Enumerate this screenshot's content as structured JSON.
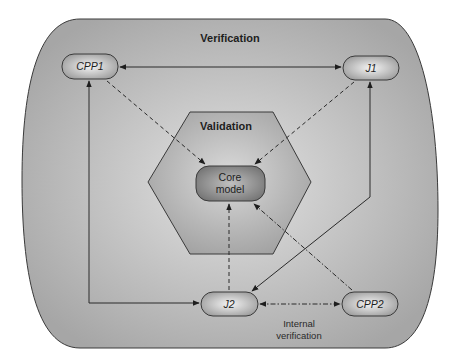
{
  "diagram": {
    "outer_region": {
      "label": "Verification"
    },
    "inner_region": {
      "label": "Validation"
    },
    "nodes": {
      "cpp1": {
        "label": "CPP1"
      },
      "j1": {
        "label": "J1"
      },
      "core": {
        "line1": "Core",
        "line2": "model"
      },
      "j2": {
        "label": "J2"
      },
      "cpp2": {
        "label": "CPP2"
      }
    },
    "annotations": {
      "internal_line1": "Internal",
      "internal_line2": "verification"
    },
    "edges": [
      {
        "from": "CPP1",
        "to": "J1",
        "style": "solid",
        "direction": "bidirectional"
      },
      {
        "from": "J2",
        "to": "CPP1",
        "style": "solid",
        "direction": "bidirectional"
      },
      {
        "from": "J2",
        "to": "J1",
        "style": "solid",
        "direction": "bidirectional"
      },
      {
        "from": "CPP1",
        "to": "Core model",
        "style": "dashed"
      },
      {
        "from": "J1",
        "to": "Core model",
        "style": "dashed"
      },
      {
        "from": "J2",
        "to": "Core model",
        "style": "dashed"
      },
      {
        "from": "CPP2",
        "to": "Core model",
        "style": "dash-dot"
      },
      {
        "from": "J2",
        "to": "CPP2",
        "style": "dash-dot",
        "direction": "bidirectional"
      }
    ],
    "colors": {
      "outer_fill": "#b9b9b9",
      "hexagon_fill": "#b0b0b0",
      "node_fill": "#c6c6c6",
      "core_fill": "#8f8f8f",
      "stroke": "#2a2a2a"
    }
  }
}
